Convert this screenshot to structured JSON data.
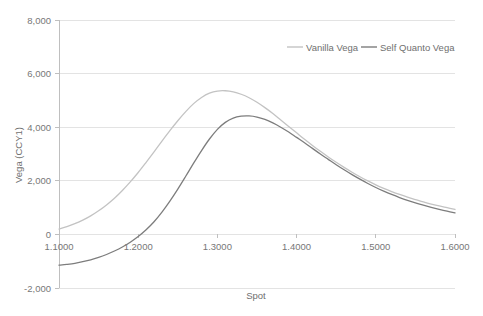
{
  "chart_data": {
    "type": "line",
    "title": "",
    "xlabel": "Spot",
    "ylabel": "Vega (CCY1)",
    "xlim": [
      1.1,
      1.6
    ],
    "ylim": [
      -2000,
      8000
    ],
    "grid": true,
    "grid_axis": "y",
    "legend_position": "top-right-inside",
    "x_tick_labels": [
      "1.1000",
      "1.2000",
      "1.3000",
      "1.4000",
      "1.5000",
      "1.6000"
    ],
    "x_ticks": [
      1.1,
      1.2,
      1.3,
      1.4,
      1.5,
      1.6
    ],
    "y_tick_labels": [
      "8,000",
      "6,000",
      "4,000",
      "2,000",
      "0",
      "-2,000"
    ],
    "y_ticks": [
      8000,
      6000,
      4000,
      2000,
      0,
      -2000
    ],
    "x": [
      1.1,
      1.11,
      1.12,
      1.13,
      1.14,
      1.15,
      1.16,
      1.17,
      1.18,
      1.19,
      1.2,
      1.21,
      1.22,
      1.23,
      1.24,
      1.25,
      1.26,
      1.27,
      1.28,
      1.29,
      1.3,
      1.31,
      1.32,
      1.33,
      1.34,
      1.35,
      1.36,
      1.37,
      1.38,
      1.39,
      1.4,
      1.41,
      1.42,
      1.43,
      1.44,
      1.45,
      1.46,
      1.47,
      1.48,
      1.49,
      1.5,
      1.51,
      1.52,
      1.53,
      1.54,
      1.55,
      1.56,
      1.57,
      1.58,
      1.59,
      1.6
    ],
    "series": [
      {
        "name": "Vanilla Vega",
        "color": "#C3C3C3",
        "values": [
          200,
          290,
          400,
          530,
          690,
          880,
          1100,
          1350,
          1640,
          1960,
          2310,
          2690,
          3080,
          3480,
          3870,
          4240,
          4580,
          4880,
          5110,
          5270,
          5350,
          5360,
          5320,
          5230,
          5100,
          4930,
          4730,
          4510,
          4270,
          4030,
          3790,
          3550,
          3320,
          3100,
          2890,
          2690,
          2500,
          2320,
          2150,
          1995,
          1850,
          1720,
          1600,
          1490,
          1390,
          1300,
          1210,
          1130,
          1060,
          995,
          930
        ]
      },
      {
        "name": "Self Quanto Vega",
        "color": "#7D7D7D",
        "values": [
          -1150,
          -1120,
          -1080,
          -1020,
          -950,
          -860,
          -750,
          -620,
          -470,
          -290,
          -80,
          170,
          470,
          830,
          1240,
          1690,
          2170,
          2660,
          3130,
          3560,
          3920,
          4180,
          4340,
          4410,
          4420,
          4380,
          4290,
          4160,
          4000,
          3820,
          3620,
          3420,
          3210,
          3000,
          2800,
          2600,
          2410,
          2230,
          2060,
          1900,
          1750,
          1615,
          1490,
          1375,
          1270,
          1175,
          1090,
          1010,
          935,
          865,
          800
        ]
      }
    ]
  },
  "axis": {
    "x_title": "Spot",
    "y_title": "Vega (CCY1)"
  },
  "legend": {
    "items": [
      {
        "label": "Vanilla Vega",
        "color": "#C3C3C3"
      },
      {
        "label": "Self Quanto Vega",
        "color": "#7D7D7D"
      }
    ]
  },
  "style": {
    "background": "#ffffff",
    "grid_color": "#E3E3E3",
    "axis_color": "#BFBFBF",
    "text_color": "#6f6f6f"
  }
}
